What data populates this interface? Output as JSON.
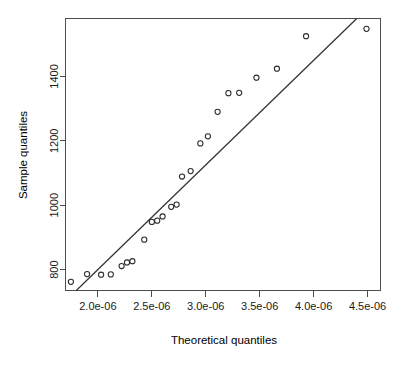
{
  "chart_data": {
    "type": "scatter",
    "title": "",
    "subtitle": "",
    "xlabel": "Theoretical quantiles",
    "ylabel": "Sample quantiles",
    "xlim": [
      1.7e-06,
      4.62e-06
    ],
    "ylim": [
      735,
      1580
    ],
    "grid": false,
    "legend": null,
    "x_ticks": [
      2e-06,
      2.5e-06,
      3e-06,
      3.5e-06,
      4e-06,
      4.5e-06
    ],
    "x_tick_labels": [
      "2.0e-06",
      "2.5e-06",
      "3.0e-06",
      "3.5e-06",
      "4.0e-06",
      "4.5e-06"
    ],
    "y_ticks": [
      800,
      1000,
      1200,
      1400
    ],
    "y_tick_labels": [
      "800",
      "1000",
      "1200",
      "1400"
    ],
    "marker": "open-circle",
    "series": [
      {
        "name": "sample quantiles",
        "x": [
          1.75e-06,
          1.9e-06,
          2.03e-06,
          2.12e-06,
          2.22e-06,
          2.27e-06,
          2.32e-06,
          2.43e-06,
          2.5e-06,
          2.55e-06,
          2.6e-06,
          2.68e-06,
          2.73e-06,
          2.78e-06,
          2.86e-06,
          2.95e-06,
          3.02e-06,
          3.11e-06,
          3.21e-06,
          3.31e-06,
          3.47e-06,
          3.66e-06,
          3.93e-06,
          4.49e-06
        ],
        "y": [
          762,
          786,
          784,
          785,
          811,
          822,
          826,
          893,
          948,
          952,
          965,
          995,
          1002,
          1089,
          1106,
          1192,
          1214,
          1290,
          1348,
          1349,
          1396,
          1424,
          1525,
          1548
        ]
      }
    ],
    "reference_line": {
      "name": "qq-line",
      "x_start": 1.8e-06,
      "y_start": 735,
      "x_end": 4.4e-06,
      "y_end": 1580
    }
  }
}
